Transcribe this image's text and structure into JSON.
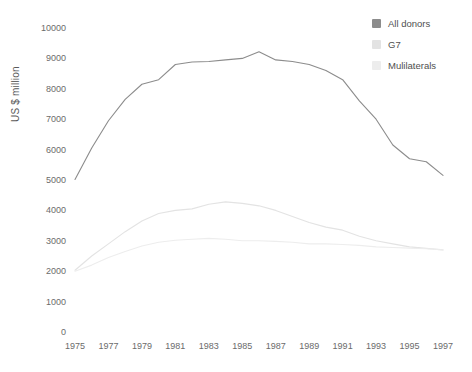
{
  "chart_data": {
    "type": "line",
    "title": "",
    "xlabel": "",
    "ylabel": "US $ million",
    "xlim": [
      1975,
      1997
    ],
    "ylim": [
      0,
      10000
    ],
    "grid": false,
    "legend_position": "top-right",
    "x": [
      1975,
      1976,
      1977,
      1978,
      1979,
      1980,
      1981,
      1982,
      1983,
      1984,
      1985,
      1986,
      1987,
      1988,
      1989,
      1990,
      1991,
      1992,
      1993,
      1994,
      1995,
      1996,
      1997
    ],
    "xticks": [
      1975,
      1977,
      1979,
      1981,
      1983,
      1985,
      1987,
      1989,
      1991,
      1993,
      1995,
      1997
    ],
    "yticks": [
      0,
      1000,
      2000,
      3000,
      4000,
      5000,
      6000,
      7000,
      8000,
      9000,
      10000
    ],
    "series": [
      {
        "name": "All donors",
        "color": "#8c8c8c",
        "values": [
          5020,
          6050,
          6950,
          7650,
          8150,
          8300,
          8800,
          8880,
          8900,
          8950,
          9000,
          9220,
          8950,
          8900,
          8800,
          8600,
          8300,
          7600,
          7000,
          6150,
          5700,
          5600,
          5150
        ]
      },
      {
        "name": "G7",
        "color": "#e3e3e3",
        "values": [
          2030,
          2500,
          2900,
          3300,
          3650,
          3900,
          4000,
          4050,
          4200,
          4280,
          4230,
          4150,
          4000,
          3800,
          3600,
          3450,
          3350,
          3150,
          3000,
          2900,
          2800,
          2750,
          2700
        ]
      },
      {
        "name": "Mulilaterals",
        "color": "#ededed",
        "values": [
          2000,
          2200,
          2450,
          2650,
          2830,
          2950,
          3020,
          3050,
          3080,
          3050,
          3000,
          3000,
          2980,
          2950,
          2900,
          2900,
          2880,
          2850,
          2800,
          2780,
          2760,
          2740,
          2700
        ]
      }
    ]
  },
  "legend": {
    "items": [
      {
        "label": "All donors",
        "color": "#8c8c8c"
      },
      {
        "label": "G7",
        "color": "#e3e3e3"
      },
      {
        "label": "Mulilaterals",
        "color": "#ededed"
      }
    ]
  },
  "axes": {
    "y_title": "US $ million",
    "y_tick_labels": [
      "10000",
      "9000",
      "8000",
      "7000",
      "6000",
      "5000",
      "4000",
      "3000",
      "2000",
      "1000",
      "0"
    ],
    "x_tick_labels": [
      "1975",
      "1977",
      "1979",
      "1981",
      "1983",
      "1985",
      "1987",
      "1989",
      "1991",
      "1993",
      "1995",
      "1997"
    ]
  }
}
